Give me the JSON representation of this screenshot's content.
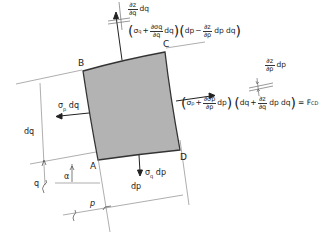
{
  "diagram": {
    "points": {
      "A": "A",
      "B": "B",
      "C": "C",
      "D": "D"
    },
    "element_fill": "#b3b3b3",
    "left_force": {
      "sym": "σ",
      "sub": "p",
      "tail": "dq"
    },
    "bottom_force": {
      "sym": "σ",
      "sub": "q",
      "tail": "dp"
    },
    "top_change": {
      "num": "∂z",
      "den": "∂q",
      "tail": "dq"
    },
    "right_change": {
      "num": "∂z",
      "den": "∂p",
      "tail": "dp"
    },
    "top_force": {
      "open1": "(",
      "sigma": "σ",
      "sigma_sub": "q",
      "plus": "+",
      "frac_num": "∂σq",
      "frac_den": "∂q",
      "d1": "dq",
      "close1": ")",
      "open2": "(",
      "dp": "dp",
      "minus": "−",
      "frac2_num": "∂z",
      "frac2_den": "∂p",
      "d2": "dp dq",
      "close2": ")"
    },
    "right_force": {
      "open1": "(",
      "sigma": "σ",
      "sigma_sub": "p",
      "plus": "+",
      "frac_num": "∂σp",
      "frac_den": "∂p",
      "d1": "dp",
      "close1": ")",
      "open2": "(",
      "dq": "dq",
      "plus2": "+",
      "frac2_num": "∂z",
      "frac2_den": "∂q",
      "d2": "dp dq",
      "close2": ")",
      "equals": "= F",
      "result_sub": "CD"
    },
    "dims": {
      "dq": "dq",
      "dp": "dp",
      "q": "q",
      "p": "p",
      "alpha": "α"
    }
  }
}
